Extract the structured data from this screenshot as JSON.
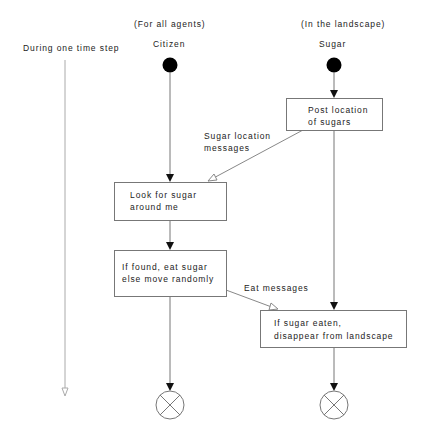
{
  "diagram": {
    "time_label": "During one time step",
    "lanes": [
      {
        "qualifier": "(For all agents)",
        "name": "Citizen"
      },
      {
        "qualifier": "(In the landscape)",
        "name": "Sugar"
      }
    ],
    "activities": [
      {
        "id": "post",
        "line1": "Post location",
        "line2": "of sugars"
      },
      {
        "id": "look",
        "line1": "Look for sugar",
        "line2": "around me"
      },
      {
        "id": "eat",
        "line1": "If found, eat sugar",
        "line2": "else move randomly"
      },
      {
        "id": "disappear",
        "line1": "If sugar eaten,",
        "line2": "disappear from landscape"
      }
    ],
    "messages": [
      {
        "line1": "Sugar location",
        "line2": "messages"
      },
      {
        "line1": "Eat messages"
      }
    ],
    "colors": {
      "line": "#777777",
      "node": "#000000",
      "text": "#222222"
    }
  }
}
